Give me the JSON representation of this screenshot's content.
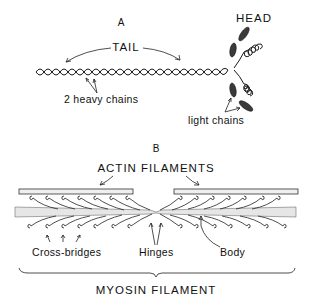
{
  "figure": {
    "panel_a": {
      "letter": "A",
      "labels": {
        "head": "HEAD",
        "tail": "TAIL",
        "heavy_chains": "2 heavy chains",
        "light_chains": "light chains"
      }
    },
    "panel_b": {
      "letter": "B",
      "labels": {
        "actin": "ACTIN FILAMENTS",
        "cross_bridges": "Cross-bridges",
        "hinges": "Hinges",
        "body": "Body",
        "myosin": "MYOSIN FILAMENT"
      }
    }
  }
}
